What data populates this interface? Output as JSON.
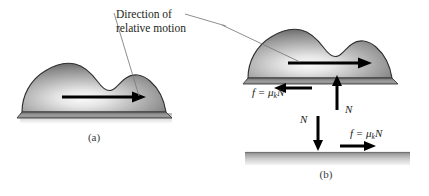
{
  "figure": {
    "callout": "Direction of\nrelative motion",
    "panel_a_caption": "(a)",
    "panel_b_caption": "(b)",
    "colors": {
      "text": "#231f20",
      "leader_line": "#6e6e6e",
      "arrow": "#000000",
      "blob_light": "#f2f2f2",
      "blob_mid": "#9a9a9a",
      "blob_dark": "#4a4a4a",
      "blob_outline": "#2b2b2b",
      "ground_top": "#8d8d8d",
      "ground_bottom": "#efefef"
    }
  },
  "panel_a": {
    "caption": "(a)",
    "motion_arrow": {
      "name": "direction-of-relative-motion-arrow",
      "direction": "right"
    }
  },
  "panel_b": {
    "caption": "(b)",
    "motion_arrow": {
      "name": "direction-of-relative-motion-arrow",
      "direction": "right"
    },
    "forces": [
      {
        "id": "friction-on-block",
        "symbol": "f",
        "equals": " = ",
        "mu": "μ",
        "subscript": "k",
        "normal": "N",
        "arrow_direction": "left",
        "label": "f = μkN"
      },
      {
        "id": "normal-on-block",
        "symbol": "N",
        "arrow_direction": "up",
        "label": "N"
      },
      {
        "id": "normal-on-surface",
        "symbol": "N",
        "arrow_direction": "down",
        "label": "N"
      },
      {
        "id": "friction-on-surface",
        "symbol": "f",
        "equals": " = ",
        "mu": "μ",
        "subscript": "k",
        "normal": "N",
        "arrow_direction": "right",
        "label": "f = μkN"
      }
    ]
  }
}
